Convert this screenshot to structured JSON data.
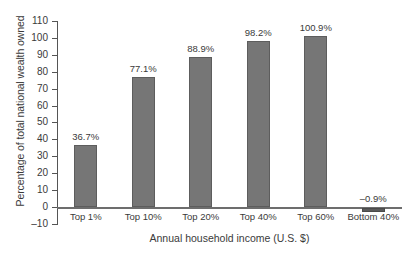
{
  "chart_data": {
    "type": "bar",
    "title": "",
    "xlabel": "Annual household income (U.S. $)",
    "ylabel": "Percentage of total national wealth owned",
    "categories": [
      "Top 1%",
      "Top 10%",
      "Top 20%",
      "Top 40%",
      "Top 60%",
      "Bottom 40%"
    ],
    "values": [
      36.7,
      77.1,
      88.9,
      98.2,
      100.9,
      -0.9
    ],
    "value_labels": [
      "36.7%",
      "77.1%",
      "88.9%",
      "98.2%",
      "100.9%",
      "–0.9%"
    ],
    "ylim": [
      -10,
      110
    ],
    "ytick_values": [
      -10,
      0,
      10,
      20,
      30,
      40,
      50,
      60,
      70,
      80,
      90,
      100,
      110
    ],
    "ytick_labels": [
      "–10",
      "0",
      "10",
      "20",
      "30",
      "40",
      "50",
      "60",
      "70",
      "80",
      "90",
      "100",
      "110"
    ],
    "grid": false,
    "legend": null,
    "bar_color": "#767676",
    "bar_edge_color": "#5d5d5d",
    "axis_color": "#555555",
    "text_color": "#3a3a3a"
  }
}
